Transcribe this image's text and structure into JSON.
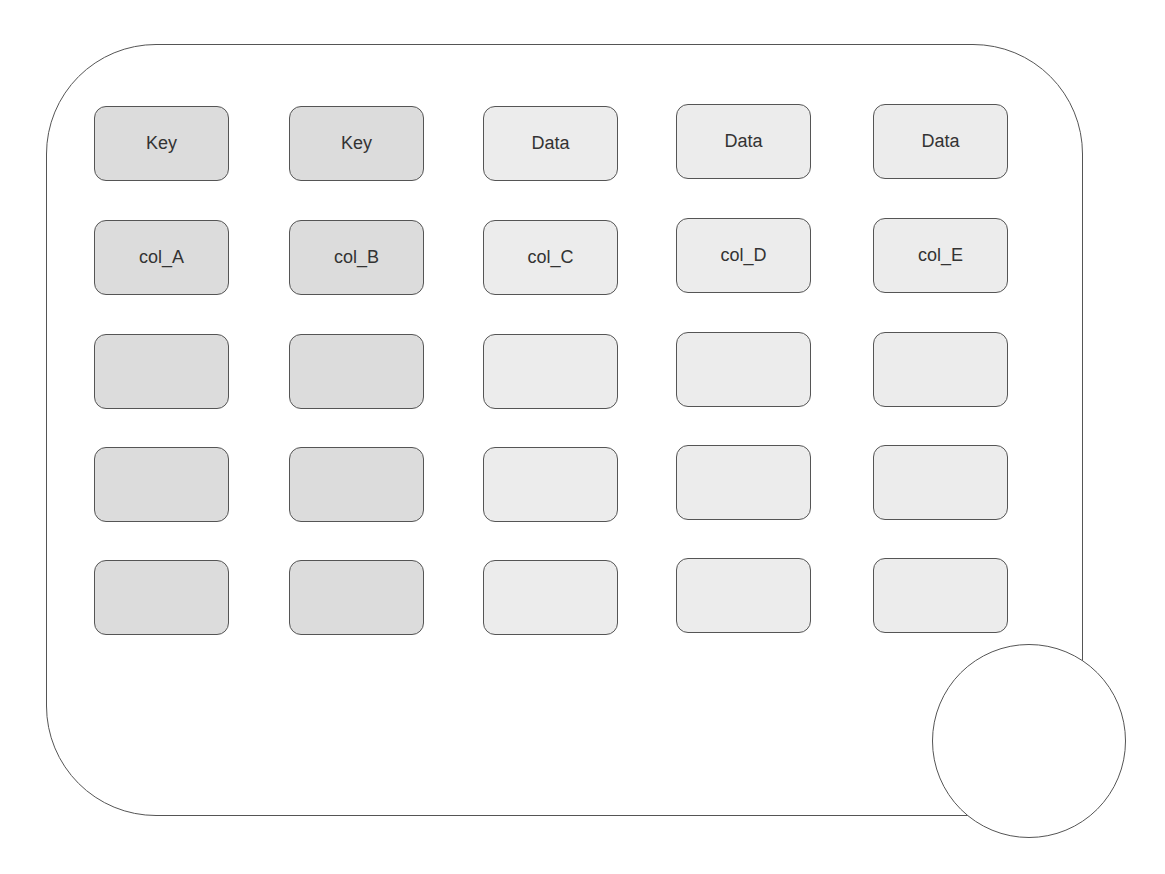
{
  "diagram": {
    "columns": [
      {
        "type": "key",
        "header": "Key",
        "name": "col_A"
      },
      {
        "type": "key",
        "header": "Key",
        "name": "col_B"
      },
      {
        "type": "data",
        "header": "Data",
        "name": "col_C"
      },
      {
        "type": "data",
        "header": "Data",
        "name": "col_D"
      },
      {
        "type": "data",
        "header": "Data",
        "name": "col_E"
      }
    ],
    "rows": [
      [
        "Key",
        "Key",
        "Data",
        "Data",
        "Data"
      ],
      [
        "col_A",
        "col_B",
        "col_C",
        "col_D",
        "col_E"
      ],
      [
        "",
        "",
        "",
        "",
        ""
      ],
      [
        "",
        "",
        "",
        "",
        ""
      ],
      [
        "",
        "",
        "",
        "",
        ""
      ]
    ],
    "colors": {
      "key_fill": "#dcdcdc",
      "data_fill": "#ececec",
      "stroke": "#555555",
      "background": "#ffffff"
    }
  }
}
